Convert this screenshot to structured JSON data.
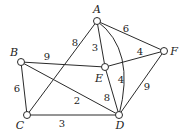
{
  "diagram": {
    "type": "weighted-undirected-graph",
    "nodes": [
      {
        "id": "A",
        "label": "A",
        "x": 97,
        "y": 21,
        "lx": 97,
        "ly": 13
      },
      {
        "id": "B",
        "label": "B",
        "x": 21,
        "y": 62,
        "lx": 14,
        "ly": 56
      },
      {
        "id": "C",
        "label": "C",
        "x": 27,
        "y": 115,
        "lx": 20,
        "ly": 129
      },
      {
        "id": "D",
        "label": "D",
        "x": 119,
        "y": 115,
        "lx": 120,
        "ly": 129
      },
      {
        "id": "E",
        "label": "E",
        "x": 105,
        "y": 67,
        "lx": 99,
        "ly": 82
      },
      {
        "id": "F",
        "label": "F",
        "x": 164,
        "y": 51,
        "lx": 174,
        "ly": 55
      }
    ],
    "edges": [
      {
        "from": "A",
        "to": "C",
        "weight": "8",
        "wx": 75,
        "wy": 46
      },
      {
        "from": "A",
        "to": "E",
        "weight": "3",
        "wx": 95,
        "wy": 51
      },
      {
        "from": "A",
        "to": "F",
        "weight": "6",
        "wx": 126,
        "wy": 32
      },
      {
        "from": "A",
        "to": "D",
        "weight": "4",
        "curved": true,
        "wx": 121,
        "wy": 83
      },
      {
        "from": "E",
        "to": "F",
        "weight": "4",
        "wx": 140,
        "wy": 55
      },
      {
        "from": "B",
        "to": "E",
        "weight": "9",
        "wx": 47,
        "wy": 60
      },
      {
        "from": "B",
        "to": "C",
        "weight": "6",
        "wx": 17,
        "wy": 92
      },
      {
        "from": "B",
        "to": "D",
        "weight": "2",
        "wx": 77,
        "wy": 104
      },
      {
        "from": "E",
        "to": "D",
        "weight": "8",
        "wx": 107,
        "wy": 101
      },
      {
        "from": "F",
        "to": "D",
        "weight": "9",
        "wx": 147,
        "wy": 90
      },
      {
        "from": "C",
        "to": "D",
        "weight": "3",
        "wx": 62,
        "wy": 127
      }
    ]
  }
}
